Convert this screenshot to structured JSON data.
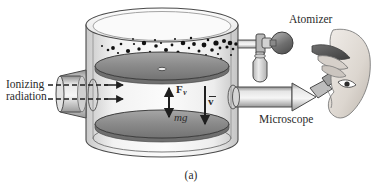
{
  "figure": {
    "caption": "(a)",
    "background_color": "#ffffff",
    "ink_color": "#2b2b2b"
  },
  "labels": {
    "ionizing_radiation_line1": "Ionizing",
    "ionizing_radiation_line2": "radiation",
    "atomizer": "Atomizer",
    "microscope": "Microscope",
    "viscous_force": "F",
    "viscous_force_subscript": "v",
    "weight": "mg",
    "velocity": "v"
  },
  "components": {
    "chamber": "cylindrical observation chamber",
    "upper_plate": "upper capacitor plate",
    "lower_plate": "lower capacitor plate",
    "pinhole": "pinhole in upper plate",
    "oil_droplets": "atomized oil droplet spray",
    "radiation_source": "ionizing radiation source tube",
    "atomizer_bulb": "rubber squeeze bulb",
    "atomizer_reservoir": "oil reservoir jar",
    "microscope_tube": "viewing microscope",
    "observer": "observer eye and hand"
  },
  "colors": {
    "outline": "#4a4a4a",
    "plate_fill": "#8d8d8d",
    "chamber_glass": "#e9e9e9",
    "metal_light": "#d8d8d8",
    "metal_dark": "#8a8a8a",
    "droplet": "#1a1a1a",
    "skin": "#d9d4cf"
  }
}
